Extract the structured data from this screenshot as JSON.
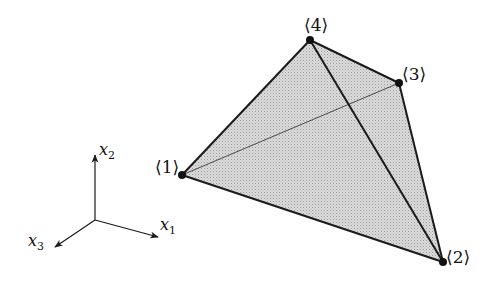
{
  "diagram": {
    "type": "tetrahedron-element",
    "fill_color": "#d4d4d4",
    "edge_color": "#1a1a1a",
    "vertices": [
      {
        "id": "1",
        "label": "⟨1⟩",
        "x": 182,
        "y": 175
      },
      {
        "id": "2",
        "label": "⟨2⟩",
        "x": 443,
        "y": 262
      },
      {
        "id": "3",
        "label": "⟨3⟩",
        "x": 399,
        "y": 83
      },
      {
        "id": "4",
        "label": "⟨4⟩",
        "x": 310,
        "y": 40
      }
    ],
    "edges": [
      {
        "from": "1",
        "to": "4",
        "style": "solid"
      },
      {
        "from": "4",
        "to": "3",
        "style": "solid"
      },
      {
        "from": "3",
        "to": "2",
        "style": "solid"
      },
      {
        "from": "2",
        "to": "1",
        "style": "solid"
      },
      {
        "from": "4",
        "to": "2",
        "style": "solid"
      },
      {
        "from": "1",
        "to": "3",
        "style": "thin-hidden"
      }
    ]
  },
  "axes": {
    "origin": {
      "x": 95,
      "y": 220
    },
    "x1": {
      "base": "x",
      "sub": "1"
    },
    "x2": {
      "base": "x",
      "sub": "2"
    },
    "x3": {
      "base": "x",
      "sub": "3"
    }
  },
  "labels": {
    "v1": "⟨1⟩",
    "v2": "⟨2⟩",
    "v3": "⟨3⟩",
    "v4": "⟨4⟩"
  }
}
